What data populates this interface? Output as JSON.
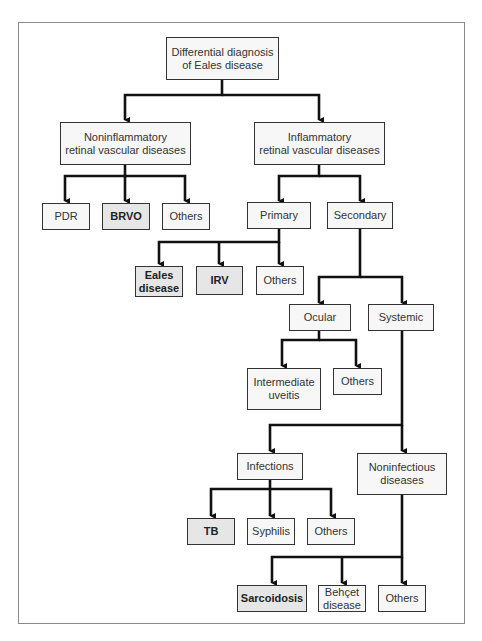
{
  "diagram": {
    "type": "flowchart-tree",
    "title": "Differential diagnosis of Eales disease",
    "nodes": [
      {
        "id": "root",
        "label": "Differential diagnosis\nof Eales disease",
        "highlight": false
      },
      {
        "id": "noninfl",
        "label": "Noninflammatory\nretinal vascular diseases",
        "highlight": false
      },
      {
        "id": "infl",
        "label": "Inflammatory\nretinal vascular diseases",
        "highlight": false
      },
      {
        "id": "pdr",
        "label": "PDR",
        "highlight": false
      },
      {
        "id": "brvo",
        "label": "BRVO",
        "highlight": true
      },
      {
        "id": "others1",
        "label": "Others",
        "highlight": false
      },
      {
        "id": "primary",
        "label": "Primary",
        "highlight": false
      },
      {
        "id": "secondary",
        "label": "Secondary",
        "highlight": false
      },
      {
        "id": "eales",
        "label": "Eales\ndisease",
        "highlight": true
      },
      {
        "id": "irv",
        "label": "IRV",
        "highlight": true
      },
      {
        "id": "others2",
        "label": "Others",
        "highlight": false
      },
      {
        "id": "ocular",
        "label": "Ocular",
        "highlight": false
      },
      {
        "id": "systemic",
        "label": "Systemic",
        "highlight": false
      },
      {
        "id": "intuveitis",
        "label": "Intermediate\nuveitis",
        "highlight": false
      },
      {
        "id": "others3",
        "label": "Others",
        "highlight": false
      },
      {
        "id": "infections",
        "label": "Infections",
        "highlight": false
      },
      {
        "id": "noninfect",
        "label": "Noninfectious\ndiseases",
        "highlight": false
      },
      {
        "id": "tb",
        "label": "TB",
        "highlight": true
      },
      {
        "id": "syphilis",
        "label": "Syphilis",
        "highlight": false
      },
      {
        "id": "others4",
        "label": "Others",
        "highlight": false
      },
      {
        "id": "sarcoid",
        "label": "Sarcoidosis",
        "highlight": true
      },
      {
        "id": "behcet",
        "label": "Behçet\ndisease",
        "highlight": false
      },
      {
        "id": "others5",
        "label": "Others",
        "highlight": false
      }
    ],
    "edges": [
      [
        "root",
        "noninfl"
      ],
      [
        "root",
        "infl"
      ],
      [
        "noninfl",
        "pdr"
      ],
      [
        "noninfl",
        "brvo"
      ],
      [
        "noninfl",
        "others1"
      ],
      [
        "infl",
        "primary"
      ],
      [
        "infl",
        "secondary"
      ],
      [
        "primary",
        "eales"
      ],
      [
        "primary",
        "irv"
      ],
      [
        "primary",
        "others2"
      ],
      [
        "secondary",
        "ocular"
      ],
      [
        "secondary",
        "systemic"
      ],
      [
        "ocular",
        "intuveitis"
      ],
      [
        "ocular",
        "others3"
      ],
      [
        "systemic",
        "infections"
      ],
      [
        "systemic",
        "noninfect"
      ],
      [
        "infections",
        "tb"
      ],
      [
        "infections",
        "syphilis"
      ],
      [
        "infections",
        "others4"
      ],
      [
        "noninfect",
        "sarcoid"
      ],
      [
        "noninfect",
        "behcet"
      ],
      [
        "noninfect",
        "others5"
      ]
    ],
    "colors": {
      "line": "#111111",
      "box_border": "#333333",
      "box_fill": "#f7f7f7",
      "highlight_fill": "#e6e6e6",
      "frame": "#8a8a8a"
    }
  }
}
